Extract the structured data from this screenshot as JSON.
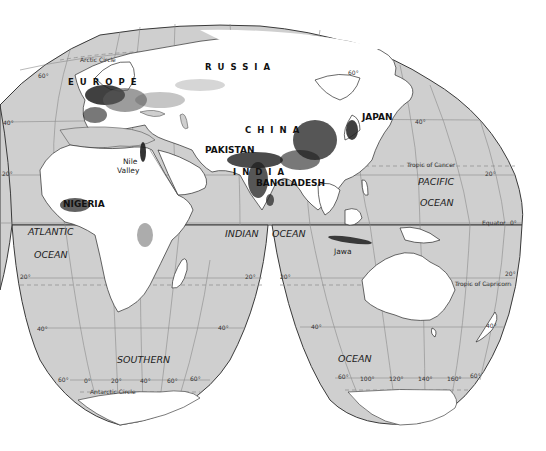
{
  "map": {
    "projection": "interrupted homolosine",
    "colors": {
      "ocean": "#cfcfcf",
      "land": "#ffffff",
      "dense_population": "#1e1e1e",
      "gridline": "#8a8a8a",
      "outline": "#3a3a3a"
    },
    "countries": {
      "russia": "RUSSIA",
      "europe": "EUROPE",
      "china": "CHINA",
      "japan": "JAPAN",
      "pakistan": "PAKISTAN",
      "india": "INDIA",
      "bangladesh": "BANGLADESH",
      "nigeria": "NIGERIA"
    },
    "features": {
      "nile": "Nile",
      "valley": "Valley",
      "jawa": "Jawa"
    },
    "oceans": {
      "atlantic": "ATLANTIC",
      "atlantic_ocean": "OCEAN",
      "indian": "INDIAN",
      "indian_ocean": "OCEAN",
      "pacific": "PACIFIC",
      "pacific_ocean": "OCEAN",
      "southern": "SOUTHERN",
      "southern_ocean": "OCEAN"
    },
    "lines": {
      "arctic_circle": "Arctic Circle",
      "tropic_cancer": "Tropic of Cancer",
      "equator": "Equator",
      "tropic_capricorn": "Tropic of Capricorn",
      "antarctic_circle": "Antarctic Circle"
    },
    "latitude_labels": {
      "n60_left": "60°",
      "n60_right": "60°",
      "n40_left": "40°",
      "n40_right": "40°",
      "n20_left": "20°",
      "n20_right": "20°",
      "eq": "0°",
      "s20_a": "20°",
      "s20_b": "20°",
      "s20_c": "20°",
      "s20_d": "20°",
      "s40_a": "40°",
      "s40_b": "40°",
      "s40_c": "40°",
      "s40_d": "40°",
      "s60_a": "60°",
      "s60_b": "60°",
      "s60_c": "60°",
      "s60_d": "60°"
    },
    "longitude_labels": {
      "lon0": "0°",
      "lon20": "20°",
      "lon40": "40°",
      "lon60": "60°",
      "lon100": "100°",
      "lon120": "120°",
      "lon140": "140°",
      "lon160": "160°"
    }
  }
}
